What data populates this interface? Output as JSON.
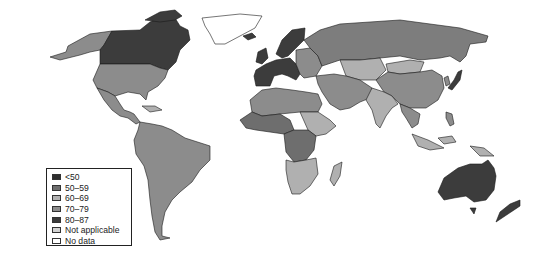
{
  "map": {
    "type": "choropleth world map",
    "palette": {
      "lt50": "#333333",
      "50_59": "#7d7d7d",
      "60_69": "#b4b4b4",
      "70_79": "#8f8f8f",
      "80_87": "#3c3c3c",
      "not_applicable": "#cfcfcf",
      "no_data": "#ffffff"
    }
  },
  "legend": {
    "items": [
      {
        "label": "<50",
        "color": "#2e2e2e"
      },
      {
        "label": "50–59",
        "color": "#6e6e6e"
      },
      {
        "label": "60–69",
        "color": "#b0b0b0"
      },
      {
        "label": "70–79",
        "color": "#8c8c8c"
      },
      {
        "label": "80–87",
        "color": "#3a3a3a"
      },
      {
        "label": "Not applicable",
        "color": "#d2d2d2"
      },
      {
        "label": "No data",
        "color": "#ffffff"
      }
    ]
  }
}
